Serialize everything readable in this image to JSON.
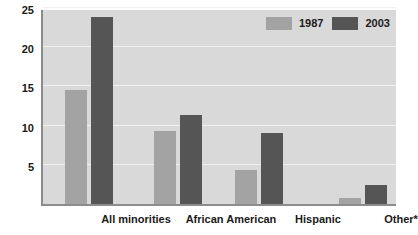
{
  "chart_data": {
    "type": "bar",
    "title": "",
    "xlabel": "",
    "ylabel": "",
    "ylim": [
      0,
      25
    ],
    "yticks": [
      5,
      10,
      15,
      20,
      25
    ],
    "grid": true,
    "legend_position": "top-right",
    "categories": [
      "All minorities",
      "African American",
      "Hispanic",
      "Other*"
    ],
    "series": [
      {
        "name": "1987",
        "color": "#a3a3a3",
        "values": [
          14.6,
          9.3,
          4.3,
          0.8
        ]
      },
      {
        "name": "2003",
        "color": "#555555",
        "values": [
          23.8,
          11.3,
          9.0,
          2.4
        ]
      }
    ]
  },
  "axes": {
    "yticks": [
      {
        "label": "25",
        "value": 25
      },
      {
        "label": "20",
        "value": 20
      },
      {
        "label": "15",
        "value": 15
      },
      {
        "label": "10",
        "value": 10
      },
      {
        "label": "5",
        "value": 5
      }
    ],
    "xticks": [
      {
        "label": "All minorities"
      },
      {
        "label": "African American"
      },
      {
        "label": "Hispanic"
      },
      {
        "label": "Other*"
      }
    ]
  },
  "legend": {
    "items": [
      {
        "label": "1987",
        "color": "#a3a3a3"
      },
      {
        "label": "2003",
        "color": "#555555"
      }
    ]
  },
  "colors": {
    "plot_background": "#d9d9d9",
    "gridline": "#f0f0f0",
    "axis": "#8c8c8c",
    "text": "#1a1a1a",
    "series_1987": "#a3a3a3",
    "series_2003": "#555555"
  }
}
